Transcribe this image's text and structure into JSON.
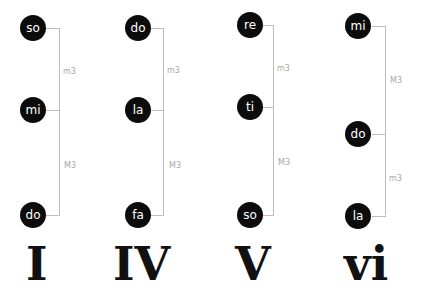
{
  "chords": [
    {
      "numeral": "I",
      "notes": {
        "top": "so",
        "middle": "mi",
        "bottom": "do"
      },
      "intervals": {
        "upper": "m3",
        "lower": "M3"
      }
    },
    {
      "numeral": "IV",
      "notes": {
        "top": "do",
        "middle": "la",
        "bottom": "fa"
      },
      "intervals": {
        "upper": "m3",
        "lower": "M3"
      }
    },
    {
      "numeral": "V",
      "notes": {
        "top": "re",
        "middle": "ti",
        "bottom": "so"
      },
      "intervals": {
        "upper": "m3",
        "lower": "M3"
      }
    },
    {
      "numeral": "vi",
      "notes": {
        "top": "mi",
        "middle": "do",
        "bottom": "la"
      },
      "intervals": {
        "upper": "M3",
        "lower": "m3"
      }
    }
  ],
  "colors": {
    "note_fill": "#0c0c0c",
    "note_text": "#ffffff",
    "bracket": "#bdbdbd",
    "interval_text": "#a8a8a8"
  }
}
